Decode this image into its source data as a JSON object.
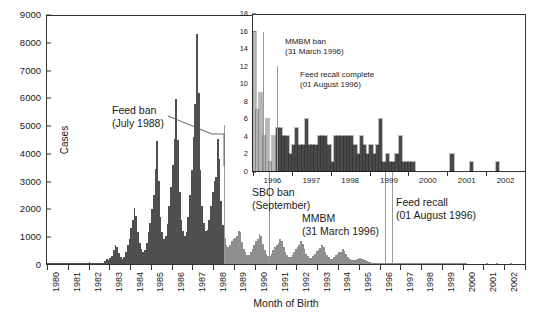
{
  "figure": {
    "ylabel": "Cases",
    "xlabel": "Month of Birth"
  },
  "annotations": [
    {
      "id": "feed-ban",
      "line1": "Feed ban",
      "line2": "(July 1988)"
    },
    {
      "id": "sbo-ban",
      "line1": "SBO ban",
      "line2": "(September)"
    },
    {
      "id": "mmbm",
      "line1": "MMBM",
      "line2": "(31 March 1996)"
    },
    {
      "id": "feed-recall",
      "line1": "Feed recall",
      "line2": "(01 August 1996)"
    },
    {
      "id": "mmbm-ban-inset",
      "line1": "MMBM ban",
      "line2": "(31 March 1996)"
    },
    {
      "id": "feed-recall-inset",
      "line1": "Feed recall complete",
      "line2": "(01 August 1996)"
    }
  ],
  "colors": {
    "bar_pre_ban": "#4f4f4f",
    "bar_post_ban": "#8f8f8f",
    "inset_bar_pre": "#b5b5b5",
    "inset_bar_post": "#4a4a4a",
    "axis": "#333333",
    "marker_line": "#9a9a9a",
    "background": "#ffffff"
  },
  "chart_data": {
    "type": "bar",
    "title": "",
    "xlabel": "Month of Birth",
    "ylabel": "Cases",
    "ylim": [
      0,
      9000
    ],
    "ytick_labels": [
      "0",
      "1000",
      "2000",
      "3000",
      "4000",
      "5000",
      "6000",
      "7000",
      "8000",
      "9000"
    ],
    "xlim_years": [
      1980,
      2003
    ],
    "xtick_labels": [
      "1980",
      "1981",
      "1982",
      "1983",
      "1984",
      "1985",
      "1986",
      "1987",
      "1988",
      "1989",
      "1990",
      "1991",
      "1992",
      "1993",
      "1994",
      "1995",
      "1996",
      "1997",
      "1998",
      "1999",
      "2000",
      "2001",
      "2002"
    ],
    "grid": false,
    "legend": "none",
    "series": [
      {
        "name": "BSE cases by month of birth",
        "note": "Monthly values, January 1980 through December 2002. Bars born before the July 1988 feed ban are dark grey; bars born after are light grey.",
        "split_index": 102,
        "values": [
          30,
          20,
          25,
          15,
          20,
          18,
          14,
          12,
          18,
          22,
          26,
          20,
          30,
          28,
          24,
          20,
          18,
          16,
          14,
          16,
          22,
          34,
          40,
          36,
          60,
          55,
          45,
          38,
          30,
          26,
          22,
          26,
          40,
          120,
          180,
          150,
          210,
          300,
          520,
          700,
          620,
          400,
          260,
          200,
          240,
          420,
          700,
          900,
          1300,
          1600,
          2050,
          1750,
          1150,
          760,
          560,
          450,
          520,
          760,
          1150,
          1500,
          2000,
          2500,
          3450,
          4450,
          3000,
          1700,
          1150,
          900,
          1000,
          1450,
          2100,
          2800,
          3600,
          4550,
          6000,
          4500,
          2600,
          1600,
          1200,
          1000,
          1150,
          1700,
          2500,
          3400,
          4600,
          5800,
          8350,
          6200,
          3400,
          2100,
          1500,
          1200,
          1250,
          1600,
          2100,
          2600,
          3000,
          3150,
          4550,
          3800,
          2300,
          1400,
          950,
          700,
          620,
          700,
          820,
          900,
          950,
          1000,
          1200,
          1150,
          800,
          560,
          420,
          340,
          330,
          420,
          560,
          700,
          820,
          900,
          1100,
          1000,
          720,
          500,
          380,
          300,
          300,
          380,
          500,
          620,
          700,
          760,
          900,
          820,
          600,
          420,
          320,
          260,
          260,
          330,
          430,
          540,
          620,
          680,
          820,
          740,
          540,
          380,
          280,
          230,
          230,
          290,
          380,
          470,
          520,
          570,
          680,
          620,
          450,
          320,
          240,
          190,
          190,
          240,
          310,
          380,
          420,
          450,
          540,
          490,
          350,
          250,
          180,
          140,
          130,
          150,
          180,
          200,
          210,
          200,
          180,
          150,
          120,
          90,
          70,
          55,
          45,
          35,
          28,
          22,
          16,
          7,
          9,
          4,
          6,
          4,
          1,
          5,
          5,
          4,
          4,
          2,
          3,
          5,
          3,
          3,
          6,
          3,
          3,
          3,
          4,
          4,
          4,
          3,
          1,
          4,
          4,
          4,
          4,
          4,
          4,
          3,
          2,
          4,
          3,
          2,
          3,
          2,
          3,
          6,
          1,
          2,
          1,
          1,
          2,
          4,
          1,
          1,
          1,
          1,
          0,
          0,
          0,
          0,
          0,
          0,
          0,
          0,
          0,
          0,
          0,
          2,
          0,
          0,
          0,
          0,
          0,
          1,
          0,
          0,
          0,
          0,
          0,
          0,
          0,
          1,
          0,
          0,
          0,
          0,
          0,
          0,
          0,
          0
        ]
      }
    ],
    "marker_lines": [
      {
        "label": "Feed ban",
        "date": "July 1988",
        "year_fraction": 1988.5
      },
      {
        "label": "SBO ban",
        "date": "September 1990",
        "year_fraction": 1990.7
      },
      {
        "label": "MMBM",
        "date": "31 March 1996",
        "year_fraction": 1996.25
      },
      {
        "label": "Feed recall",
        "date": "01 August 1996",
        "year_fraction": 1996.58
      }
    ],
    "inset": {
      "type": "bar",
      "ylim": [
        0,
        18
      ],
      "ytick_labels": [
        "0",
        "2",
        "4",
        "6",
        "8",
        "10",
        "12",
        "14",
        "16",
        "18"
      ],
      "xtick_labels": [
        "1996",
        "1997",
        "1998",
        "1999",
        "2000",
        "2001",
        "2002"
      ],
      "xlim_years": [
        1996,
        2003
      ],
      "grid": false,
      "note": "Enlargement of 1996-2002 births. Pale bars are births before the 31 March 1996 MMBM ban / 01 August 1996 feed recall; dark bars after.",
      "split_index": 7,
      "values": [
        16,
        7,
        9,
        4,
        6,
        1,
        4,
        5,
        5,
        4,
        4,
        2,
        3,
        5,
        3,
        3,
        6,
        3,
        3,
        3,
        4,
        4,
        4,
        3,
        1,
        4,
        4,
        4,
        4,
        4,
        4,
        3,
        2,
        4,
        3,
        2,
        3,
        2,
        3,
        6,
        1,
        2,
        1,
        1,
        2,
        4,
        1,
        1,
        1,
        1,
        0,
        0,
        0,
        0,
        0,
        0,
        0,
        0,
        0,
        0,
        0,
        2,
        0,
        0,
        0,
        0,
        0,
        1,
        0,
        0,
        0,
        0,
        0,
        0,
        0,
        1,
        0,
        0,
        0,
        0,
        0,
        0,
        0,
        0
      ],
      "marker_lines": [
        {
          "label": "MMBM ban",
          "date": "31 March 1996",
          "index": 3
        },
        {
          "label": "Feed recall complete",
          "date": "01 August 1996",
          "index": 7.5
        }
      ]
    }
  }
}
